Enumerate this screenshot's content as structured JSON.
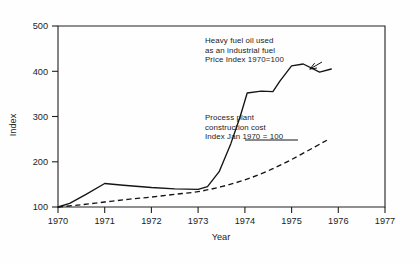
{
  "chart_data": {
    "type": "line",
    "title": "",
    "xlabel": "Year",
    "ylabel": "Index",
    "xlim": [
      1970,
      1977
    ],
    "ylim": [
      100,
      500
    ],
    "grid": false,
    "legend_position": "inline-annotations",
    "x_ticks": [
      "1970",
      "1971",
      "1972",
      "1973",
      "1974",
      "1975",
      "1976",
      "1977"
    ],
    "y_ticks": [
      "100",
      "200",
      "300",
      "400",
      "500"
    ],
    "series": [
      {
        "name": "Heavy fuel oil used as an industrial fuel, Price Index 1970=100",
        "style": "dashed",
        "x": [
          1970.0,
          1970.25,
          1970.6,
          1971.0,
          1971.4,
          1972.0,
          1972.5,
          1973.0,
          1973.2,
          1973.45,
          1973.7,
          1973.9,
          1974.05,
          1974.35,
          1974.6,
          1974.75,
          1975.0,
          1975.25,
          1975.6,
          1975.85
        ],
        "values": [
          100,
          108,
          128,
          152,
          148,
          143,
          140,
          139,
          145,
          178,
          240,
          300,
          352,
          356,
          355,
          378,
          412,
          416,
          398,
          405
        ]
      },
      {
        "name": "Process plant construction cost Index Jan 1970 = 100",
        "style": "solid",
        "x": [
          1970.0,
          1970.5,
          1971.0,
          1971.5,
          1972.0,
          1972.5,
          1973.0,
          1973.5,
          1974.0,
          1974.5,
          1975.0,
          1975.5,
          1975.8
        ],
        "values": [
          100,
          105,
          111,
          117,
          122,
          128,
          134,
          145,
          160,
          180,
          205,
          233,
          250
        ]
      }
    ],
    "annotations": [
      {
        "id": "fuel",
        "lines": [
          "Heavy fuel oil used",
          "as an industrial fuel",
          "Price Index 1970=100"
        ],
        "target_x": 1975.85,
        "target_y": 405
      },
      {
        "id": "plant",
        "lines": [
          "Process plant",
          "construction cost",
          "Index  Jan 1970 = 100"
        ],
        "target_x": 1974.3,
        "target_y": 172
      }
    ]
  }
}
